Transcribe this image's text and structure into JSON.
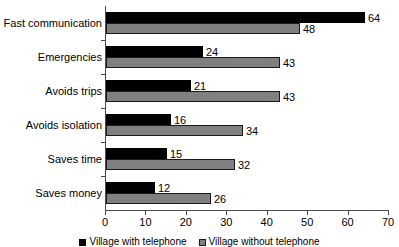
{
  "chart_data": {
    "type": "bar",
    "orientation": "horizontal",
    "title": "",
    "xlabel": "",
    "ylabel": "",
    "xlim": [
      0,
      70
    ],
    "xticks": [
      0,
      10,
      20,
      30,
      40,
      50,
      60,
      70
    ],
    "grid": false,
    "legend_position": "bottom",
    "categories": [
      "Fast communication",
      "Emergencies",
      "Avoids trips",
      "Avoids isolation",
      "Saves time",
      "Saves money"
    ],
    "series": [
      {
        "name": "Village with telephone",
        "color": "#000000",
        "values": [
          64,
          24,
          21,
          16,
          15,
          12
        ]
      },
      {
        "name": "Village without telephone",
        "color": "#808080",
        "values": [
          48,
          43,
          43,
          34,
          32,
          26
        ]
      }
    ]
  },
  "axis": {
    "tick_labels": [
      "0",
      "10",
      "20",
      "30",
      "40",
      "50",
      "60",
      "70"
    ]
  },
  "legend": {
    "items": [
      {
        "label": "Village with telephone",
        "swatch": "black-square-marker"
      },
      {
        "label": "Village without telephone",
        "swatch": "gray-square-marker"
      }
    ]
  }
}
